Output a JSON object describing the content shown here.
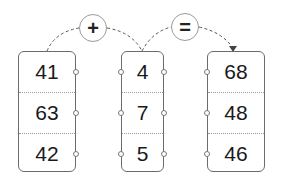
{
  "diagram": {
    "operator_plus": "+",
    "operator_equals": "=",
    "columns": [
      {
        "name": "addend-a",
        "values": [
          "41",
          "63",
          "42"
        ]
      },
      {
        "name": "addend-b",
        "values": [
          "4",
          "7",
          "5"
        ]
      },
      {
        "name": "sum",
        "values": [
          "68",
          "48",
          "46"
        ]
      }
    ]
  },
  "colors": {
    "border": "#6b6b6b",
    "dashed_link": "#555555",
    "operator_circle": "#9a9a9a"
  }
}
